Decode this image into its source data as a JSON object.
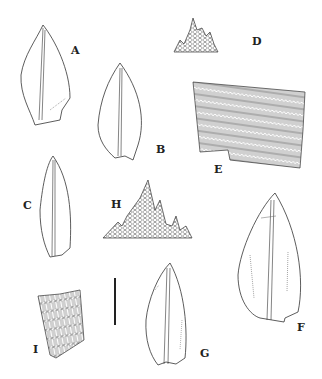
{
  "figure": {
    "type": "botanical-illustration",
    "panels": [
      {
        "id": "A",
        "label": "A",
        "content": "leaf outline with costa"
      },
      {
        "id": "B",
        "label": "B",
        "content": "leaf outline with costa"
      },
      {
        "id": "C",
        "label": "C",
        "content": "leaf outline with costa"
      },
      {
        "id": "D",
        "label": "D",
        "content": "leaf apex cells"
      },
      {
        "id": "E",
        "label": "E",
        "content": "basal leaf cells"
      },
      {
        "id": "F",
        "label": "F",
        "content": "leaf outline with costa"
      },
      {
        "id": "G",
        "label": "G",
        "content": "leaf outline with costa"
      },
      {
        "id": "H",
        "label": "H",
        "content": "leaf apex cells"
      },
      {
        "id": "I",
        "label": "I",
        "content": "leaf cells"
      }
    ],
    "scale_bar": {
      "label": ""
    },
    "ink_color": "#333333",
    "background": "#ffffff"
  }
}
